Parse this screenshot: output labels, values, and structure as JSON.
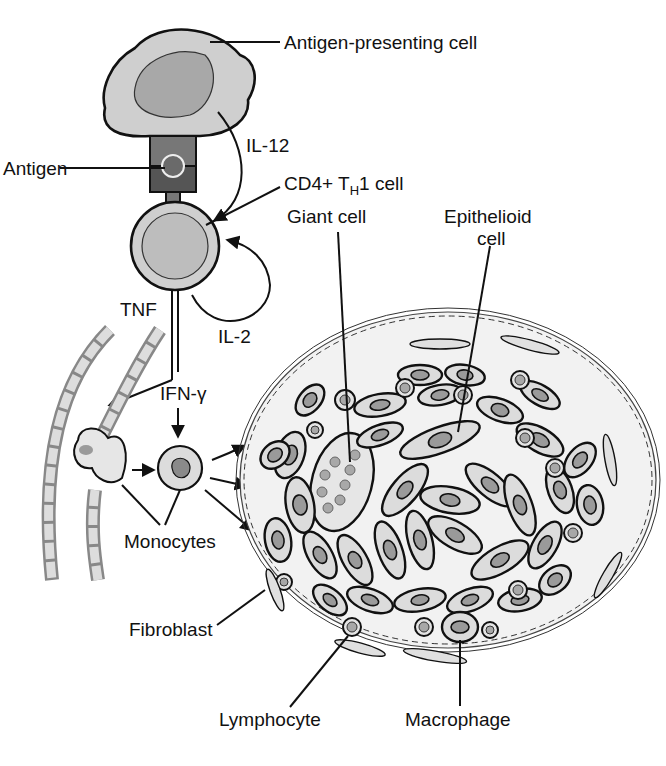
{
  "diagram": {
    "labels": {
      "apc": "Antigen-presenting cell",
      "il12": "IL-12",
      "antigen": "Antigen",
      "th1_prefix": "CD4+ T",
      "th1_sub": "H",
      "th1_suffix": "1 cell",
      "giant_cell": "Giant cell",
      "epithelioid_line1": "Epithelioid",
      "epithelioid_line2": "cell",
      "tnf": "TNF",
      "il2": "IL-2",
      "ifn": "IFN-γ",
      "monocytes": "Monocytes",
      "fibroblast": "Fibroblast",
      "lymphocyte": "Lymphocyte",
      "macrophage": "Macrophage"
    },
    "colors": {
      "cytoplasm": "#dcdcdc",
      "nucleus": "#9a9a9a",
      "outline": "#111111",
      "background": "#ffffff"
    }
  }
}
